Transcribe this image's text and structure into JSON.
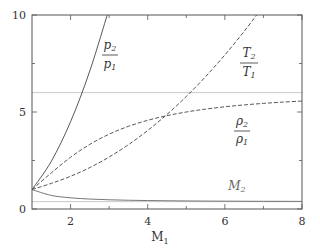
{
  "chart_data": {
    "type": "line",
    "title": "",
    "xlabel": "M1",
    "ylabel": "",
    "xlim": [
      1,
      8
    ],
    "ylim": [
      0,
      10
    ],
    "xticks": [
      2,
      4,
      6,
      8
    ],
    "xminor_ticks": [
      3,
      5,
      7
    ],
    "yticks": [
      0,
      5,
      10
    ],
    "yminor_ticks": [
      2.5,
      7.5
    ],
    "grid": false,
    "legend": "none (inline labels)",
    "reference_lines": [
      {
        "y": 6.0,
        "color": "#bbbbbb",
        "note": "density ratio limit"
      },
      {
        "y": 0.378,
        "color": "#bbbbbb",
        "note": "M2 limit"
      }
    ],
    "x": [
      1.0,
      1.5,
      2.0,
      2.5,
      3.0,
      3.5,
      4.0,
      4.5,
      5.0,
      5.5,
      6.0,
      6.5,
      7.0,
      7.5,
      8.0
    ],
    "series": [
      {
        "name": "p2/p1",
        "style": "solid",
        "values": [
          1.0,
          2.458,
          4.5,
          7.125,
          10.333,
          null,
          null,
          null,
          null,
          null,
          null,
          null,
          null,
          null,
          null
        ]
      },
      {
        "name": "T2/T1",
        "style": "dashed",
        "values": [
          1.0,
          1.32,
          1.687,
          2.137,
          2.679,
          3.315,
          4.047,
          4.875,
          5.8,
          6.822,
          7.941,
          9.156,
          10.47,
          null,
          null
        ]
      },
      {
        "name": "rho2/rho1",
        "style": "dashed",
        "values": [
          1.0,
          1.862,
          2.667,
          3.333,
          3.857,
          4.261,
          4.571,
          4.812,
          5.0,
          5.149,
          5.268,
          5.365,
          5.444,
          5.51,
          5.565
        ]
      },
      {
        "name": "M2",
        "style": "solid",
        "values": [
          1.0,
          0.701,
          0.577,
          0.513,
          0.475,
          0.451,
          0.435,
          0.424,
          0.415,
          0.409,
          0.404,
          0.4,
          0.397,
          0.395,
          0.393
        ]
      }
    ],
    "annotations": [
      {
        "text_num": "p2",
        "text_den": "p1",
        "x": 2.6,
        "y": 7.5
      },
      {
        "text_num": "T2",
        "text_den": "T1",
        "x": 6.6,
        "y": 7.2
      },
      {
        "text_num": "ρ2",
        "text_den": "ρ1",
        "x": 6.6,
        "y": 2.5
      },
      {
        "text": "M2",
        "x": 6.5,
        "y": 0.9
      }
    ]
  },
  "axes": {
    "xlabel_main": "M",
    "xlabel_sub": "1",
    "ytick_labels": [
      "0",
      "5",
      "10"
    ],
    "xtick_labels": [
      "2",
      "4",
      "6",
      "8"
    ]
  },
  "labels": {
    "p_num": "p",
    "p_num_sub": "2",
    "p_den": "p",
    "p_den_sub": "1",
    "t_num": "T",
    "t_num_sub": "2",
    "t_den": "T",
    "t_den_sub": "1",
    "r_num": "ρ",
    "r_num_sub": "2",
    "r_den": "ρ",
    "r_den_sub": "1",
    "m2": "M",
    "m2_sub": "2"
  }
}
